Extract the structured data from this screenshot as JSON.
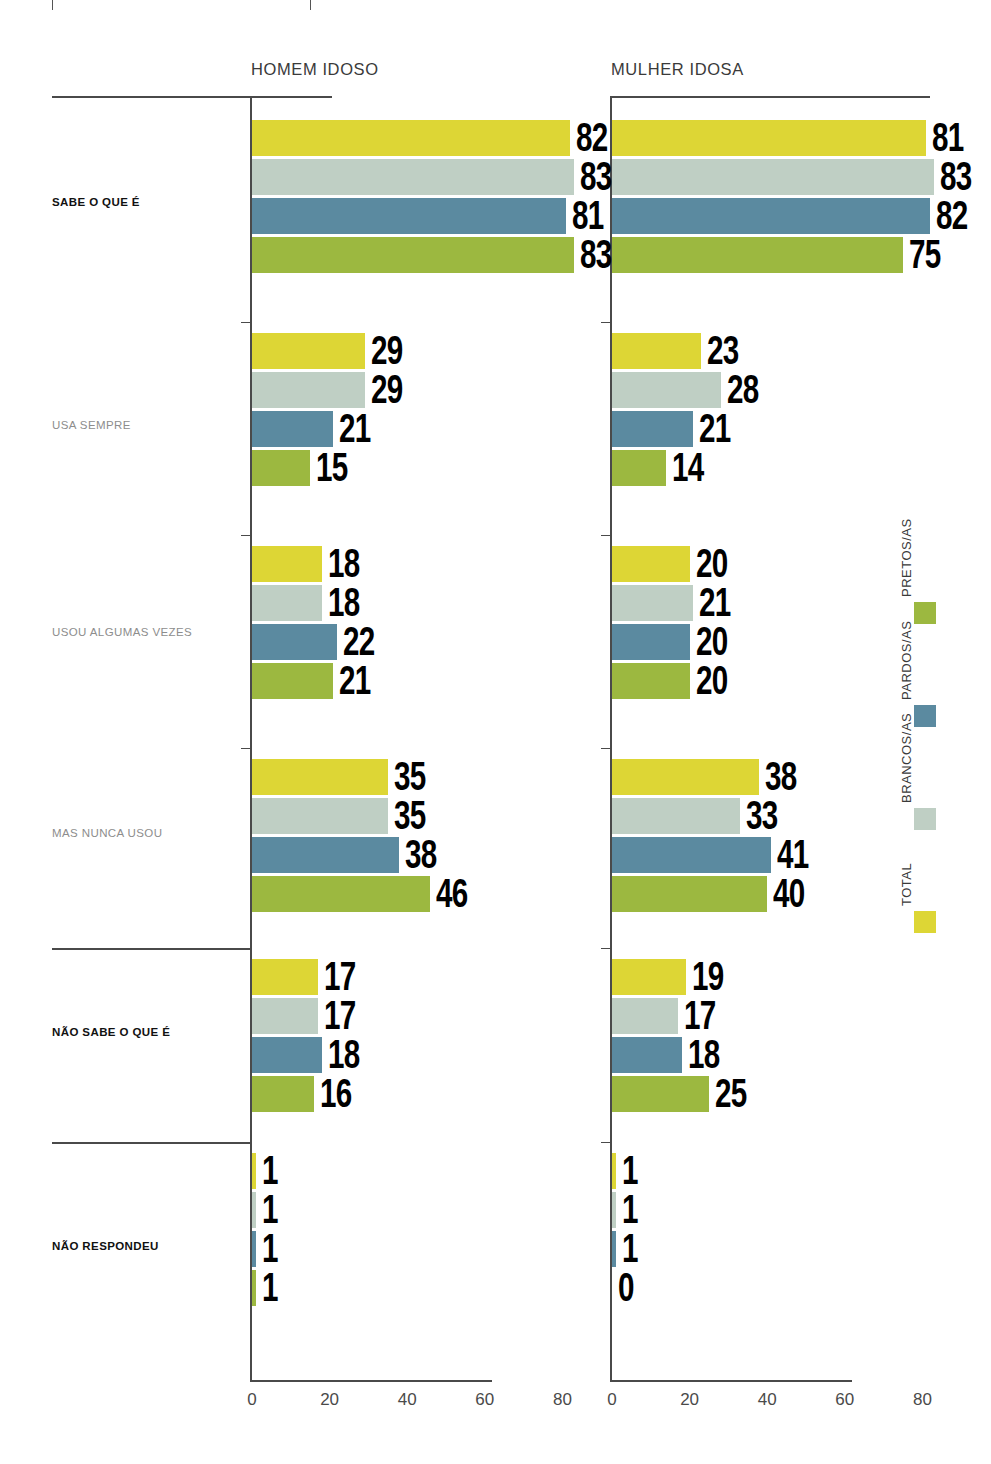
{
  "panels": [
    {
      "key": "homem",
      "title": "HOMEM IDOSO"
    },
    {
      "key": "mulher",
      "title": "MULHER IDOSA"
    }
  ],
  "categories": [
    {
      "key": "sabe",
      "label": "SABE O QUE É",
      "emphasis": "bold"
    },
    {
      "key": "usa_sempre",
      "label": "USA SEMPRE",
      "emphasis": "light"
    },
    {
      "key": "usou_algumas",
      "label": "USOU ALGUMAS VEZES",
      "emphasis": "light"
    },
    {
      "key": "nunca_usou",
      "label": "MAS NUNCA USOU",
      "emphasis": "light"
    },
    {
      "key": "nao_sabe",
      "label": "NÃO SABE O QUE É",
      "emphasis": "bold"
    },
    {
      "key": "nao_respondeu",
      "label": "NÃO RESPONDEU",
      "emphasis": "bold"
    }
  ],
  "legend": {
    "items": [
      {
        "key": "pretos",
        "label": "PRETOS/AS",
        "color": "#9cb840"
      },
      {
        "key": "pardos",
        "label": "PARDOS/AS",
        "color": "#5b8aa0"
      },
      {
        "key": "brancos",
        "label": "BRANCOS/AS",
        "color": "#bfcfc4"
      },
      {
        "key": "total",
        "label": "TOTAL",
        "color": "#ddd635"
      }
    ]
  },
  "axis": {
    "ticks": [
      "0",
      "20",
      "40",
      "60",
      "80"
    ],
    "tick_values": [
      0,
      20,
      40,
      60,
      80
    ],
    "xlim": [
      0,
      90
    ]
  },
  "chart_data": {
    "type": "bar",
    "title": "",
    "xlabel": "",
    "ylabel": "",
    "orientation": "horizontal",
    "grid": false,
    "legend_position": "right-vertical",
    "xlim": [
      0,
      90
    ],
    "xticks": [
      0,
      20,
      40,
      60,
      80
    ],
    "categories": [
      "SABE O QUE É",
      "USA SEMPRE",
      "USOU ALGUMAS VEZES",
      "MAS NUNCA USOU",
      "NÃO SABE O QUE É",
      "NÃO RESPONDEU"
    ],
    "panels": [
      {
        "name": "HOMEM IDOSO",
        "series": [
          {
            "name": "TOTAL",
            "color": "#ddd635",
            "values": [
              82,
              29,
              18,
              35,
              17,
              1
            ]
          },
          {
            "name": "BRANCOS/AS",
            "color": "#bfcfc4",
            "values": [
              83,
              29,
              18,
              35,
              17,
              1
            ]
          },
          {
            "name": "PARDOS/AS",
            "color": "#5b8aa0",
            "values": [
              81,
              21,
              22,
              38,
              18,
              1
            ]
          },
          {
            "name": "PRETOS/AS",
            "color": "#9cb840",
            "values": [
              83,
              15,
              21,
              46,
              16,
              1
            ]
          }
        ]
      },
      {
        "name": "MULHER IDOSA",
        "series": [
          {
            "name": "TOTAL",
            "color": "#ddd635",
            "values": [
              81,
              23,
              20,
              38,
              19,
              1
            ]
          },
          {
            "name": "BRANCOS/AS",
            "color": "#bfcfc4",
            "values": [
              83,
              28,
              21,
              33,
              17,
              1
            ]
          },
          {
            "name": "PARDOS/AS",
            "color": "#5b8aa0",
            "values": [
              82,
              21,
              20,
              41,
              18,
              1
            ]
          },
          {
            "name": "PRETOS/AS",
            "color": "#9cb840",
            "values": [
              75,
              14,
              20,
              40,
              25,
              0
            ]
          }
        ]
      }
    ]
  }
}
